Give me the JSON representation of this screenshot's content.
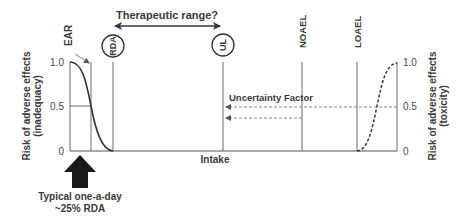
{
  "title": "Therapeutic range?",
  "markers": {
    "ear": "EAR",
    "rda": "RDA",
    "ul": "UL",
    "noael": "NOAEL",
    "loael": "LOAEL"
  },
  "x_axis_label": "Intake",
  "left_axis": {
    "label_line1": "Risk of adverse effects",
    "label_line2": "(inadequacy)",
    "ticks": [
      "1.0",
      "0.5",
      "0"
    ]
  },
  "right_axis": {
    "label_line1": "Risk of adverse effects",
    "label_line2": "(toxicity)",
    "ticks": [
      "1.0",
      "0.5",
      "0"
    ]
  },
  "uncertainty_label": "Uncertainty Factor",
  "callout": {
    "line1": "Typical one-a-day",
    "line2": "~25% RDA"
  },
  "colors": {
    "line": "#6a6a6a",
    "curve": "#333333",
    "arrow": "#1a1a1a"
  }
}
